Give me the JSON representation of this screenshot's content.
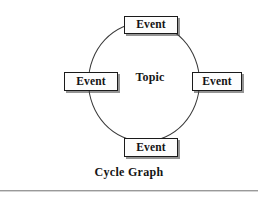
{
  "diagram": {
    "type": "cycle-graph",
    "caption": "Cycle Graph",
    "center": {
      "label": "Topic"
    },
    "nodes": [
      {
        "position": "top",
        "label": "Event"
      },
      {
        "position": "right",
        "label": "Event"
      },
      {
        "position": "bottom",
        "label": "Event"
      },
      {
        "position": "left",
        "label": "Event"
      }
    ],
    "colors": {
      "background": "#ffffff",
      "circle_stroke": "#3a3a3a",
      "node_fill": "#fdfdfd",
      "node_stroke": "#1a1a1a",
      "node_shadow": "#3c3c3c",
      "text": "#131313",
      "rule": "#9a9a9a"
    }
  }
}
